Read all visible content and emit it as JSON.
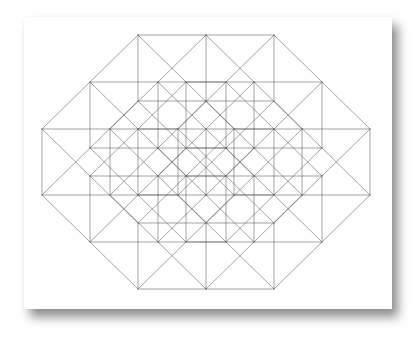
{
  "figure": {
    "origin": [
      138,
      35
    ],
    "generators": [
      {
        "name": "e1",
        "vector": [
          68,
          0
        ],
        "count": 2
      },
      {
        "name": "e2",
        "vector": [
          0,
          66
        ],
        "count": 1
      },
      {
        "name": "d1",
        "vector": [
          48,
          47
        ],
        "count": 2
      },
      {
        "name": "d2",
        "vector": [
          -48,
          47
        ],
        "count": 2
      }
    ],
    "stroke_color": "#4a4a4a",
    "stroke_opacity": 0.5,
    "stroke_width": 1,
    "outline_vertices": [
      [
        138,
        35
      ],
      [
        274,
        35
      ],
      [
        322,
        82
      ],
      [
        370,
        129
      ],
      [
        370,
        195
      ],
      [
        322,
        242
      ],
      [
        274,
        289
      ],
      [
        138,
        289
      ],
      [
        90,
        242
      ],
      [
        42,
        195
      ],
      [
        42,
        129
      ],
      [
        90,
        82
      ]
    ]
  },
  "card": {
    "background": "#ffffff",
    "shadow": "drop-shadow bottom-right"
  }
}
